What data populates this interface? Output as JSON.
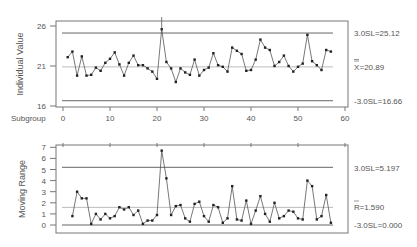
{
  "chart_data": [
    {
      "type": "line",
      "title": "",
      "xlabel": "Subgroup",
      "ylabel": "Individual Value",
      "ylim": [
        16,
        26
      ],
      "xlim": [
        0,
        60
      ],
      "y_ticks": [
        16,
        21,
        26
      ],
      "x_ticks": [
        0,
        10,
        20,
        30,
        40,
        50,
        60
      ],
      "grid": false,
      "control_limits": {
        "ucl": {
          "value": 25.12,
          "label": "3.0SL=25.12"
        },
        "center": {
          "value": 20.89,
          "label": "X̿=20.89"
        },
        "lcl": {
          "value": 16.66,
          "label": "-3.0SL=16.66"
        }
      },
      "x": [
        1,
        2,
        3,
        4,
        5,
        6,
        7,
        8,
        9,
        10,
        11,
        12,
        13,
        14,
        15,
        16,
        17,
        18,
        19,
        20,
        21,
        22,
        23,
        24,
        25,
        26,
        27,
        28,
        29,
        30,
        31,
        32,
        33,
        34,
        35,
        36,
        37,
        38,
        39,
        40,
        41,
        42,
        43,
        44,
        45,
        46,
        47,
        48,
        49,
        50,
        51,
        52,
        53,
        54,
        55,
        56,
        57
      ],
      "series": [
        {
          "name": "Individual Value",
          "values": [
            22.1,
            22.8,
            19.8,
            22.2,
            19.8,
            19.9,
            20.8,
            20.4,
            21.4,
            21.9,
            22.7,
            21.2,
            19.8,
            21.4,
            22.3,
            21.1,
            21.1,
            20.7,
            20.3,
            19.4,
            25.6,
            21.5,
            20.7,
            19.0,
            20.7,
            20.2,
            19.9,
            21.8,
            19.8,
            20.5,
            20.8,
            22.6,
            21.1,
            20.9,
            20.3,
            23.3,
            22.9,
            22.5,
            20.4,
            20.5,
            21.8,
            24.3,
            23.3,
            23.0,
            21.0,
            21.5,
            22.3,
            21.0,
            20.3,
            20.9,
            21.3,
            24.9,
            21.6,
            21.1,
            20.5,
            23.0,
            22.8
          ]
        }
      ]
    },
    {
      "type": "line",
      "title": "",
      "xlabel": "",
      "ylabel": "Moving Range",
      "ylim": [
        0,
        7
      ],
      "xlim": [
        0,
        60
      ],
      "y_ticks": [
        0,
        1,
        2,
        3,
        4,
        5,
        6,
        7
      ],
      "grid": false,
      "control_limits": {
        "ucl": {
          "value": 5.197,
          "label": "3.0SL=5.197"
        },
        "center": {
          "value": 1.59,
          "label": "R̄=1.590"
        },
        "lcl": {
          "value": 0.0,
          "label": "-3.0SL=0.000"
        }
      },
      "x": [
        2,
        3,
        4,
        5,
        6,
        7,
        8,
        9,
        10,
        11,
        12,
        13,
        14,
        15,
        16,
        17,
        18,
        19,
        20,
        21,
        22,
        23,
        24,
        25,
        26,
        27,
        28,
        29,
        30,
        31,
        32,
        33,
        34,
        35,
        36,
        37,
        38,
        39,
        40,
        41,
        42,
        43,
        44,
        45,
        46,
        47,
        48,
        49,
        50,
        51,
        52,
        53,
        54,
        55,
        56,
        57
      ],
      "series": [
        {
          "name": "Moving Range",
          "values": [
            0.8,
            3.0,
            2.4,
            2.4,
            0.1,
            1.0,
            0.5,
            1.0,
            0.6,
            0.8,
            1.6,
            1.4,
            1.6,
            0.9,
            1.3,
            0.1,
            0.4,
            0.4,
            0.9,
            6.7,
            4.2,
            0.9,
            1.7,
            1.8,
            0.6,
            0.3,
            1.9,
            2.1,
            0.8,
            0.3,
            1.8,
            1.6,
            0.2,
            0.6,
            3.5,
            0.5,
            0.4,
            2.2,
            0.1,
            1.3,
            2.6,
            1.0,
            0.3,
            2.0,
            0.6,
            0.8,
            1.3,
            1.2,
            0.6,
            0.5,
            4.0,
            3.5,
            0.5,
            0.8,
            2.7,
            0.2
          ]
        }
      ]
    }
  ],
  "top_chart": {
    "ylabel": "Individual Value",
    "xlabel": "Subgroup",
    "y_ticks": [
      "26",
      "21",
      "16"
    ],
    "x_ticks": [
      "0",
      "10",
      "20",
      "30",
      "40",
      "50",
      "60"
    ],
    "ucl_label": "3.0SL=25.12",
    "center_label": "=20.89",
    "center_symbol": "X",
    "lcl_label": "-3.0SL=16.66"
  },
  "bottom_chart": {
    "ylabel": "Moving Range",
    "y_ticks": [
      "7",
      "6",
      "5",
      "4",
      "3",
      "2",
      "1",
      "0"
    ],
    "ucl_label": "3.0SL=5.197",
    "center_label": "=1.590",
    "center_symbol": "R",
    "lcl_label": "-3.0SL=0.000"
  },
  "colors": {
    "line": "#555555",
    "marker": "#222222",
    "limit": "#666666",
    "center": "#aaaaaa",
    "frame": "#777777"
  }
}
